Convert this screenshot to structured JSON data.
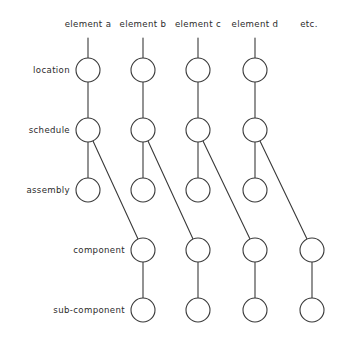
{
  "diagram": {
    "style": {
      "line_color": "#3a3a3a",
      "node_fill": "#ffffff",
      "text_color": "#2b2b2b",
      "background": "#ffffff",
      "node_radius": 12,
      "stroke_width": 1.1
    },
    "columns": [
      {
        "id": "col-a",
        "label": "element a",
        "x": 88,
        "label_x": 88,
        "label_y": 24
      },
      {
        "id": "col-b",
        "label": "element b",
        "x": 143,
        "label_x": 143,
        "label_y": 24
      },
      {
        "id": "col-c",
        "label": "element c",
        "x": 198,
        "label_x": 198,
        "label_y": 24
      },
      {
        "id": "col-d",
        "label": "element d",
        "x": 255,
        "label_x": 255,
        "label_y": 24
      },
      {
        "id": "col-etc",
        "label": "etc.",
        "x": 312,
        "label_x": 309,
        "label_y": 24
      }
    ],
    "rows": [
      {
        "id": "row-location",
        "label": "location",
        "y": 70,
        "label_x": 70,
        "label_y": 70
      },
      {
        "id": "row-schedule",
        "label": "schedule",
        "y": 130,
        "label_x": 70,
        "label_y": 130
      },
      {
        "id": "row-assembly",
        "label": "assembly",
        "y": 190,
        "label_x": 70,
        "label_y": 190
      },
      {
        "id": "row-component",
        "label": "component",
        "y": 250,
        "label_x": 125,
        "label_y": 250
      },
      {
        "id": "row-sub-component",
        "label": "sub-component",
        "y": 310,
        "label_x": 125,
        "label_y": 310
      }
    ],
    "nodes": [
      {
        "id": "n-a-location",
        "col": "col-a",
        "row": "row-location",
        "cx": 88,
        "cy": 70
      },
      {
        "id": "n-a-schedule",
        "col": "col-a",
        "row": "row-schedule",
        "cx": 88,
        "cy": 130
      },
      {
        "id": "n-a-assembly",
        "col": "col-a",
        "row": "row-assembly",
        "cx": 88,
        "cy": 190
      },
      {
        "id": "n-b-location",
        "col": "col-b",
        "row": "row-location",
        "cx": 143,
        "cy": 70
      },
      {
        "id": "n-b-schedule",
        "col": "col-b",
        "row": "row-schedule",
        "cx": 143,
        "cy": 130
      },
      {
        "id": "n-b-assembly",
        "col": "col-b",
        "row": "row-assembly",
        "cx": 143,
        "cy": 190
      },
      {
        "id": "n-b-component",
        "col": "col-b",
        "row": "row-component",
        "cx": 143,
        "cy": 250
      },
      {
        "id": "n-b-sub-component",
        "col": "col-b",
        "row": "row-sub-component",
        "cx": 143,
        "cy": 310
      },
      {
        "id": "n-c-location",
        "col": "col-c",
        "row": "row-location",
        "cx": 198,
        "cy": 70
      },
      {
        "id": "n-c-schedule",
        "col": "col-c",
        "row": "row-schedule",
        "cx": 198,
        "cy": 130
      },
      {
        "id": "n-c-assembly",
        "col": "col-c",
        "row": "row-assembly",
        "cx": 198,
        "cy": 190
      },
      {
        "id": "n-c-component",
        "col": "col-c",
        "row": "row-component",
        "cx": 198,
        "cy": 250
      },
      {
        "id": "n-c-sub-component",
        "col": "col-c",
        "row": "row-sub-component",
        "cx": 198,
        "cy": 310
      },
      {
        "id": "n-d-location",
        "col": "col-d",
        "row": "row-location",
        "cx": 255,
        "cy": 70
      },
      {
        "id": "n-d-schedule",
        "col": "col-d",
        "row": "row-schedule",
        "cx": 255,
        "cy": 130
      },
      {
        "id": "n-d-assembly",
        "col": "col-d",
        "row": "row-assembly",
        "cx": 255,
        "cy": 190
      },
      {
        "id": "n-d-component",
        "col": "col-d",
        "row": "row-component",
        "cx": 255,
        "cy": 250
      },
      {
        "id": "n-d-sub-component",
        "col": "col-d",
        "row": "row-sub-component",
        "cx": 255,
        "cy": 310
      },
      {
        "id": "n-etc-component",
        "col": "col-etc",
        "row": "row-component",
        "cx": 312,
        "cy": 250
      },
      {
        "id": "n-etc-sub-component",
        "col": "col-etc",
        "row": "row-sub-component",
        "cx": 312,
        "cy": 310
      }
    ],
    "edges": [
      {
        "id": "e-a-stub",
        "kind": "stub",
        "x1": 88,
        "y1": 38,
        "x2": 88,
        "y2": 58
      },
      {
        "id": "e-b-stub",
        "kind": "stub",
        "x1": 143,
        "y1": 38,
        "x2": 143,
        "y2": 58
      },
      {
        "id": "e-c-stub",
        "kind": "stub",
        "x1": 198,
        "y1": 38,
        "x2": 198,
        "y2": 58
      },
      {
        "id": "e-d-stub",
        "kind": "stub",
        "x1": 255,
        "y1": 38,
        "x2": 255,
        "y2": 58
      },
      {
        "id": "e-a-loc-sch",
        "kind": "vertical",
        "x1": 88,
        "y1": 82,
        "x2": 88,
        "y2": 118
      },
      {
        "id": "e-a-sch-asm",
        "kind": "vertical",
        "x1": 88,
        "y1": 142,
        "x2": 88,
        "y2": 178
      },
      {
        "id": "e-b-loc-sch",
        "kind": "vertical",
        "x1": 143,
        "y1": 82,
        "x2": 143,
        "y2": 118
      },
      {
        "id": "e-b-sch-asm",
        "kind": "vertical",
        "x1": 143,
        "y1": 142,
        "x2": 143,
        "y2": 178
      },
      {
        "id": "e-b-cmp-sub",
        "kind": "vertical",
        "x1": 143,
        "y1": 262,
        "x2": 143,
        "y2": 298
      },
      {
        "id": "e-c-loc-sch",
        "kind": "vertical",
        "x1": 198,
        "y1": 82,
        "x2": 198,
        "y2": 118
      },
      {
        "id": "e-c-sch-asm",
        "kind": "vertical",
        "x1": 198,
        "y1": 142,
        "x2": 198,
        "y2": 178
      },
      {
        "id": "e-c-cmp-sub",
        "kind": "vertical",
        "x1": 198,
        "y1": 262,
        "x2": 198,
        "y2": 298
      },
      {
        "id": "e-d-loc-sch",
        "kind": "vertical",
        "x1": 255,
        "y1": 82,
        "x2": 255,
        "y2": 118
      },
      {
        "id": "e-d-sch-asm",
        "kind": "vertical",
        "x1": 255,
        "y1": 142,
        "x2": 255,
        "y2": 178
      },
      {
        "id": "e-d-cmp-sub",
        "kind": "vertical",
        "x1": 255,
        "y1": 262,
        "x2": 255,
        "y2": 298
      },
      {
        "id": "e-etc-cmp-sub",
        "kind": "vertical",
        "x1": 312,
        "y1": 262,
        "x2": 312,
        "y2": 298
      },
      {
        "id": "e-a-sch-to-b-cmp",
        "kind": "diagonal",
        "x1": 93,
        "y1": 141,
        "x2": 138,
        "y2": 239
      },
      {
        "id": "e-b-sch-to-c-cmp",
        "kind": "diagonal",
        "x1": 148,
        "y1": 141,
        "x2": 193,
        "y2": 239
      },
      {
        "id": "e-c-sch-to-d-cmp",
        "kind": "diagonal",
        "x1": 203,
        "y1": 141,
        "x2": 250,
        "y2": 239
      },
      {
        "id": "e-d-sch-to-etc-cmp",
        "kind": "diagonal",
        "x1": 260,
        "y1": 141,
        "x2": 307,
        "y2": 239
      }
    ]
  }
}
